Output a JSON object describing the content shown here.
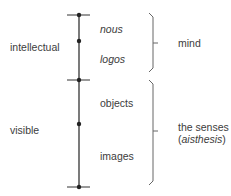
{
  "diagram": {
    "title": "",
    "left_labels": [
      {
        "text": "intellectual"
      },
      {
        "text": "visible"
      }
    ],
    "segment_labels": [
      {
        "text": "nous",
        "italic": true
      },
      {
        "text": "logos",
        "italic": true
      },
      {
        "text": "objects",
        "italic": false
      },
      {
        "text": "images",
        "italic": false
      }
    ],
    "right_labels": [
      {
        "text": "mind"
      },
      {
        "line1": "the senses",
        "line2_open": "(",
        "line2_italic": "aisthesis",
        "line2_close": ")"
      }
    ],
    "colors": {
      "line": "#333333",
      "bracket": "#666666",
      "text": "#3c3c3c"
    }
  }
}
